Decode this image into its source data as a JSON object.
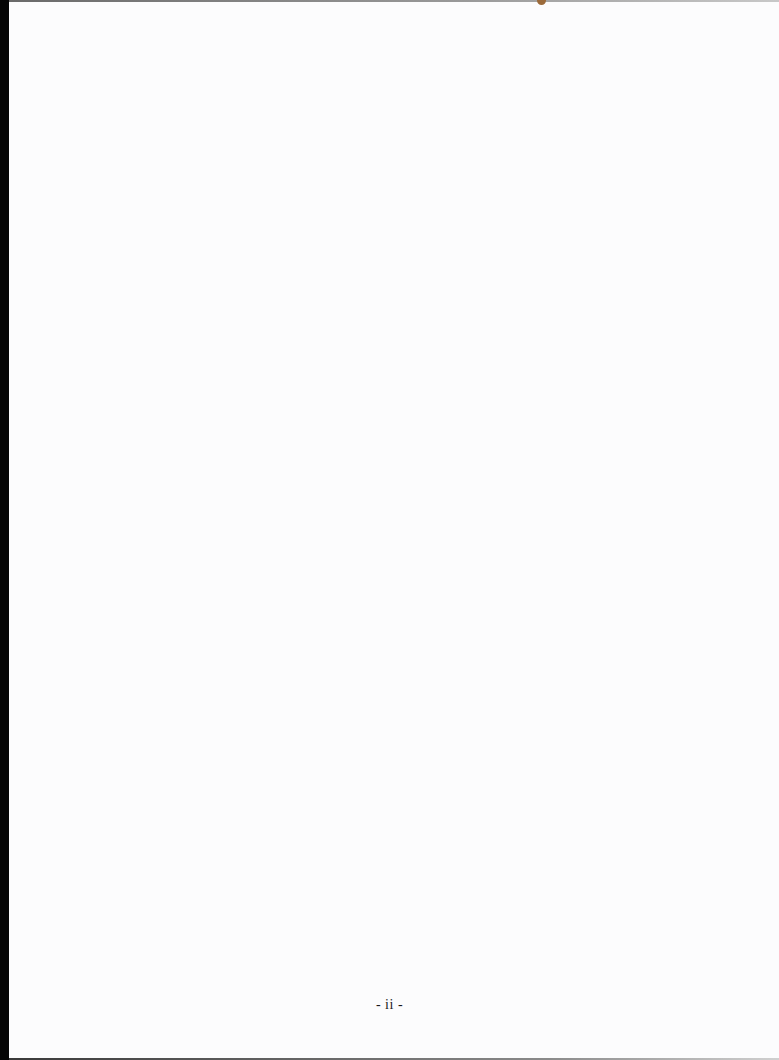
{
  "page": {
    "footer": {
      "page_number": "- ii -"
    },
    "colors": {
      "paper": "#fcfcfd",
      "scan_edge": "#050505",
      "text": "#1a1a1a"
    }
  }
}
